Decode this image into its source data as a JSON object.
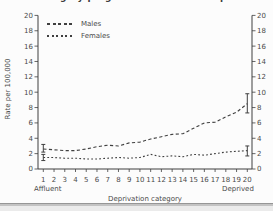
{
  "page": {
    "cropped_title_fragment_left": "g yp g",
    "cropped_title_fragment_right": "p"
  },
  "chart_data": {
    "type": "line",
    "ylabel": "Rate per 100,000",
    "xlabel": "Deprivation category",
    "x_start_label": "Affluent",
    "x_end_label": "Deprived",
    "categories": [
      1,
      2,
      3,
      4,
      5,
      6,
      7,
      8,
      9,
      10,
      11,
      12,
      13,
      14,
      15,
      16,
      17,
      18,
      19,
      20
    ],
    "y_ticks": [
      0,
      2,
      4,
      6,
      8,
      10,
      12,
      14,
      16,
      18,
      20
    ],
    "ylim": [
      0,
      20
    ],
    "dual_axis": true,
    "grid": false,
    "legend_position": "top-left",
    "line_color": "#3f3f3f",
    "text_color": "#4a4a4a",
    "series": [
      {
        "name": "Males",
        "dash": "long",
        "values": [
          2.6,
          2.5,
          2.4,
          2.4,
          2.6,
          2.9,
          3.1,
          3.0,
          3.4,
          3.5,
          3.9,
          4.2,
          4.5,
          4.6,
          5.3,
          6.0,
          6.1,
          6.8,
          7.4,
          8.5
        ],
        "error_bars": [
          {
            "x": 1,
            "low": 2.2,
            "high": 3.2
          },
          {
            "x": 20,
            "low": 7.3,
            "high": 9.8
          }
        ]
      },
      {
        "name": "Females",
        "dash": "short",
        "values": [
          1.5,
          1.5,
          1.4,
          1.4,
          1.3,
          1.3,
          1.4,
          1.5,
          1.4,
          1.5,
          1.9,
          1.6,
          1.7,
          1.6,
          1.9,
          1.8,
          2.0,
          2.2,
          2.3,
          2.4
        ],
        "error_bars": [
          {
            "x": 1,
            "low": 1.1,
            "high": 1.9
          },
          {
            "x": 20,
            "low": 1.7,
            "high": 3.0
          }
        ]
      }
    ]
  }
}
